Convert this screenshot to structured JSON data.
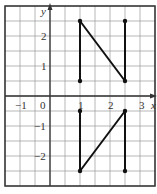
{
  "diagram": {
    "axes": {
      "x_label": "x",
      "y_label": "y",
      "origin_label": "0",
      "x_ticks": [
        {
          "value": -1,
          "label": "−1"
        },
        {
          "value": 1,
          "label": "1"
        },
        {
          "value": 2,
          "label": "2"
        },
        {
          "value": 3,
          "label": "3"
        }
      ],
      "y_ticks": [
        {
          "value": 2,
          "label": "2"
        },
        {
          "value": 1,
          "label": "1"
        },
        {
          "value": -1,
          "label": "−1"
        },
        {
          "value": -2,
          "label": "−2"
        }
      ],
      "x_range": [
        -1.5,
        3.5
      ],
      "y_range": [
        -3,
        3
      ],
      "grid_step": 0.5
    },
    "shapes": [
      {
        "name": "letter-N-upper",
        "points": [
          [
            1,
            0.5
          ],
          [
            1,
            2.5
          ],
          [
            2.5,
            0.5
          ],
          [
            2.5,
            2.5
          ]
        ]
      },
      {
        "name": "letter-N-lower-reflected",
        "points": [
          [
            1,
            -0.5
          ],
          [
            1,
            -2.5
          ],
          [
            2.5,
            -0.5
          ],
          [
            2.5,
            -2.5
          ]
        ]
      }
    ],
    "colors": {
      "grid": "#9a9a9a",
      "axis": "#333333",
      "shape": "#111111"
    }
  }
}
